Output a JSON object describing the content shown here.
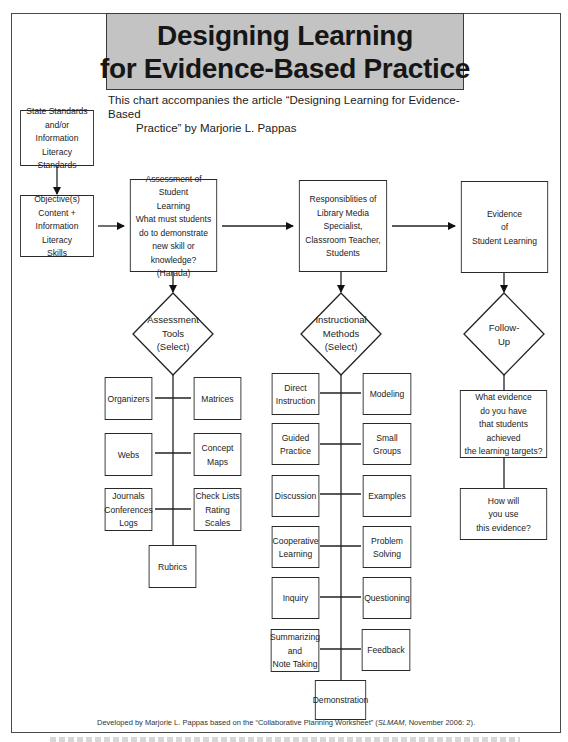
{
  "title": {
    "line1": "Designing Learning",
    "line2": "for Evidence-Based Practice",
    "banner_color": "#c3c3c3"
  },
  "subtitle": {
    "line1": "This chart accompanies the article “Designing Learning for Evidence-Based",
    "line2": "Practice” by Marjorie L. Pappas"
  },
  "column1": {
    "standards_box": "State Standards\nand/or\nInformation Literacy\nStandards",
    "objectives_box": "Objective(s)\nContent +\nInformation Literacy\nSkills"
  },
  "column2": {
    "header_box": "Assessment of Student\nLearning\nWhat must students\ndo to demonstrate\nnew skill or knowledge?\n(Harada)",
    "diamond": "Assessment\nTools\n(Select)",
    "tools": [
      {
        "label": "Organizers"
      },
      {
        "label": "Matrices"
      },
      {
        "label": "Webs"
      },
      {
        "label": "Concept Maps"
      },
      {
        "label": "Journals\nConferences\nLogs"
      },
      {
        "label": "Check Lists\nRating Scales"
      },
      {
        "label": "Rubrics"
      }
    ]
  },
  "column3": {
    "header_box": "Responsiblities of\nLibrary Media Specialist,\nClassroom Teacher,\nStudents",
    "diamond": "Instructional\nMethods\n(Select)",
    "methods": [
      {
        "label": "Direct\nInstruction"
      },
      {
        "label": "Modeling"
      },
      {
        "label": "Guided\nPractice"
      },
      {
        "label": "Small Groups"
      },
      {
        "label": "Discussion"
      },
      {
        "label": "Examples"
      },
      {
        "label": "Cooperative\nLearning"
      },
      {
        "label": "Problem\nSolving"
      },
      {
        "label": "Inquiry"
      },
      {
        "label": "Questioning"
      },
      {
        "label": "Summarizing\nand\nNote Taking"
      },
      {
        "label": "Feedback"
      },
      {
        "label": "Demonstration"
      }
    ]
  },
  "column4": {
    "header_box": "Evidence\nof\nStudent Learning",
    "diamond": "Follow-\nUp",
    "question1": "What evidence\ndo you have\nthat students achieved\nthe learning targets?",
    "question2": "How will\nyou use\nthis evidence?"
  },
  "footer": {
    "prefix": "Developed by Marjorie L. Pappas based on the “Collaborative Planning Worksheet” (",
    "italic": "SLMAM",
    "suffix": ", November 2006: 2)."
  }
}
